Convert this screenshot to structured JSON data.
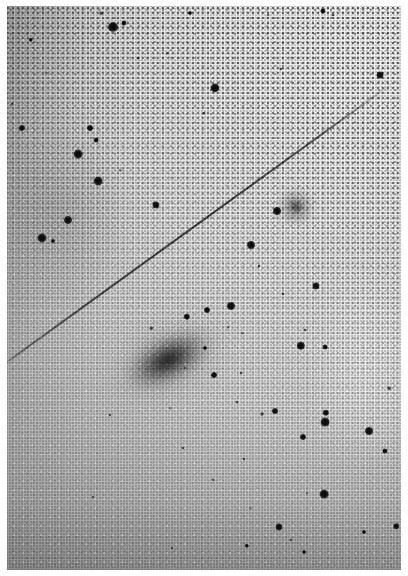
{
  "figure": {
    "kind": "astronomical-photographic-plate",
    "medium": "black-and-white photographic print / digitized sky-survey plate",
    "orientation": "portrait",
    "width_px": 408,
    "height_px": 576,
    "paper_border_px": {
      "top": 6,
      "left": 7,
      "right": 7,
      "bottom": 6
    },
    "background": {
      "description": "Grainy emulsion sky background with a smooth brightness gradient running from a dark, coarse-grained lower-left corner to a bright, smooth upper-right corner.",
      "bright_corner": "top-right",
      "bright_hex": "#f0f0f0",
      "mid_hex": "#d6d6d6",
      "dark_corner": "bottom-left",
      "dark_hex": "#a4a4a4",
      "grain_visible": true
    }
  },
  "objects": {
    "galaxy_main": {
      "name": "main-galaxy",
      "label": "large diffuse elongated galaxy",
      "center_x": 168,
      "center_y": 360,
      "width": 118,
      "height": 62,
      "halo_width": 168,
      "halo_height": 104,
      "angle_deg": -27,
      "core_hex": "#191919"
    },
    "galaxy_companion": {
      "name": "companion-galaxy",
      "label": "small faint fuzzy companion",
      "center_x": 296,
      "center_y": 207,
      "width": 38,
      "height": 34,
      "core_width": 14,
      "core_height": 12,
      "core_hex": "#5f5f5f"
    },
    "satellite_trail": {
      "name": "satellite-trail",
      "label": "straight diagonal satellite / meteor streak crossing the plate",
      "x1": 0,
      "y1": 366,
      "x2": 394,
      "y2": 81,
      "angle_deg": -35.9,
      "length": 486,
      "stroke_hex": "#3a3a3a"
    }
  },
  "stars": [
    {
      "x": 113,
      "y": 27,
      "r": 5.0,
      "c": "bright"
    },
    {
      "x": 124,
      "y": 23,
      "r": 2.6,
      "c": "mid"
    },
    {
      "x": 31,
      "y": 40,
      "r": 2.2,
      "c": "mid"
    },
    {
      "x": 101,
      "y": 13,
      "r": 1.8,
      "c": "faint"
    },
    {
      "x": 190,
      "y": 13,
      "r": 2.0,
      "c": "mid"
    },
    {
      "x": 323,
      "y": 11,
      "r": 2.6,
      "c": "mid"
    },
    {
      "x": 333,
      "y": 15,
      "r": 1.6,
      "c": "faint"
    },
    {
      "x": 268,
      "y": 15,
      "r": 1.4,
      "c": "vfaint"
    },
    {
      "x": 215,
      "y": 88,
      "r": 4.6,
      "c": "bright"
    },
    {
      "x": 281,
      "y": 69,
      "r": 1.6,
      "c": "faint"
    },
    {
      "x": 380,
      "y": 75,
      "r": 3.4,
      "c": "mid"
    },
    {
      "x": 404,
      "y": 74,
      "r": 3.0,
      "c": "mid"
    },
    {
      "x": 46,
      "y": 73,
      "r": 1.4,
      "c": "vfaint"
    },
    {
      "x": 138,
      "y": 58,
      "r": 1.5,
      "c": "faint"
    },
    {
      "x": 167,
      "y": 53,
      "r": 1.3,
      "c": "vfaint"
    },
    {
      "x": 22,
      "y": 128,
      "r": 3.0,
      "c": "bright"
    },
    {
      "x": 90,
      "y": 128,
      "r": 3.0,
      "c": "bright"
    },
    {
      "x": 96,
      "y": 140,
      "r": 2.4,
      "c": "mid"
    },
    {
      "x": 78,
      "y": 154,
      "r": 4.4,
      "c": "bright"
    },
    {
      "x": 98,
      "y": 181,
      "r": 4.4,
      "c": "bright"
    },
    {
      "x": 156,
      "y": 205,
      "r": 3.6,
      "c": "bright"
    },
    {
      "x": 68,
      "y": 220,
      "r": 4.0,
      "c": "bright"
    },
    {
      "x": 42,
      "y": 238,
      "r": 4.6,
      "c": "bright"
    },
    {
      "x": 53,
      "y": 241,
      "r": 2.0,
      "c": "mid"
    },
    {
      "x": 12,
      "y": 104,
      "r": 1.6,
      "c": "faint"
    },
    {
      "x": 120,
      "y": 170,
      "r": 1.3,
      "c": "vfaint"
    },
    {
      "x": 204,
      "y": 113,
      "r": 1.5,
      "c": "faint"
    },
    {
      "x": 251,
      "y": 245,
      "r": 4.0,
      "c": "bright"
    },
    {
      "x": 277,
      "y": 211,
      "r": 4.0,
      "c": "bright"
    },
    {
      "x": 259,
      "y": 266,
      "r": 1.6,
      "c": "faint"
    },
    {
      "x": 316,
      "y": 286,
      "r": 3.6,
      "c": "bright"
    },
    {
      "x": 283,
      "y": 294,
      "r": 1.6,
      "c": "faint"
    },
    {
      "x": 231,
      "y": 306,
      "r": 4.0,
      "c": "bright"
    },
    {
      "x": 207,
      "y": 310,
      "r": 3.0,
      "c": "mid"
    },
    {
      "x": 305,
      "y": 330,
      "r": 1.6,
      "c": "faint"
    },
    {
      "x": 301,
      "y": 346,
      "r": 4.2,
      "c": "bright"
    },
    {
      "x": 325,
      "y": 347,
      "r": 2.4,
      "c": "mid"
    },
    {
      "x": 205,
      "y": 348,
      "r": 2.0,
      "c": "mid"
    },
    {
      "x": 187,
      "y": 317,
      "r": 3.2,
      "c": "mid"
    },
    {
      "x": 228,
      "y": 327,
      "r": 1.4,
      "c": "vfaint"
    },
    {
      "x": 185,
      "y": 368,
      "r": 1.5,
      "c": "faint"
    },
    {
      "x": 214,
      "y": 375,
      "r": 3.0,
      "c": "mid"
    },
    {
      "x": 241,
      "y": 373,
      "r": 1.5,
      "c": "faint"
    },
    {
      "x": 110,
      "y": 415,
      "r": 1.6,
      "c": "faint"
    },
    {
      "x": 170,
      "y": 408,
      "r": 1.4,
      "c": "vfaint"
    },
    {
      "x": 237,
      "y": 402,
      "r": 1.6,
      "c": "faint"
    },
    {
      "x": 275,
      "y": 411,
      "r": 3.0,
      "c": "bright"
    },
    {
      "x": 326,
      "y": 413,
      "r": 3.2,
      "c": "bright"
    },
    {
      "x": 325,
      "y": 422,
      "r": 4.4,
      "c": "bright"
    },
    {
      "x": 303,
      "y": 437,
      "r": 3.0,
      "c": "mid"
    },
    {
      "x": 369,
      "y": 431,
      "r": 4.0,
      "c": "bright"
    },
    {
      "x": 385,
      "y": 451,
      "r": 2.6,
      "c": "mid"
    },
    {
      "x": 262,
      "y": 414,
      "r": 2.0,
      "c": "faint"
    },
    {
      "x": 244,
      "y": 459,
      "r": 1.6,
      "c": "faint"
    },
    {
      "x": 307,
      "y": 493,
      "r": 1.4,
      "c": "vfaint"
    },
    {
      "x": 324,
      "y": 494,
      "r": 4.4,
      "c": "bright"
    },
    {
      "x": 279,
      "y": 527,
      "r": 3.6,
      "c": "bright"
    },
    {
      "x": 291,
      "y": 540,
      "r": 1.6,
      "c": "faint"
    },
    {
      "x": 396,
      "y": 526,
      "r": 2.8,
      "c": "mid"
    },
    {
      "x": 364,
      "y": 532,
      "r": 2.0,
      "c": "mid"
    },
    {
      "x": 304,
      "y": 552,
      "r": 2.0,
      "c": "mid"
    },
    {
      "x": 183,
      "y": 448,
      "r": 1.6,
      "c": "faint"
    },
    {
      "x": 213,
      "y": 480,
      "r": 1.5,
      "c": "faint"
    },
    {
      "x": 93,
      "y": 497,
      "r": 1.5,
      "c": "faint"
    },
    {
      "x": 172,
      "y": 548,
      "r": 1.5,
      "c": "faint"
    },
    {
      "x": 247,
      "y": 546,
      "r": 2.2,
      "c": "mid"
    },
    {
      "x": 250,
      "y": 508,
      "r": 1.3,
      "c": "vfaint"
    },
    {
      "x": 151,
      "y": 328,
      "r": 1.8,
      "c": "faint"
    },
    {
      "x": 389,
      "y": 388,
      "r": 1.8,
      "c": "faint"
    },
    {
      "x": 242,
      "y": 333,
      "r": 1.3,
      "c": "vfaint"
    }
  ]
}
